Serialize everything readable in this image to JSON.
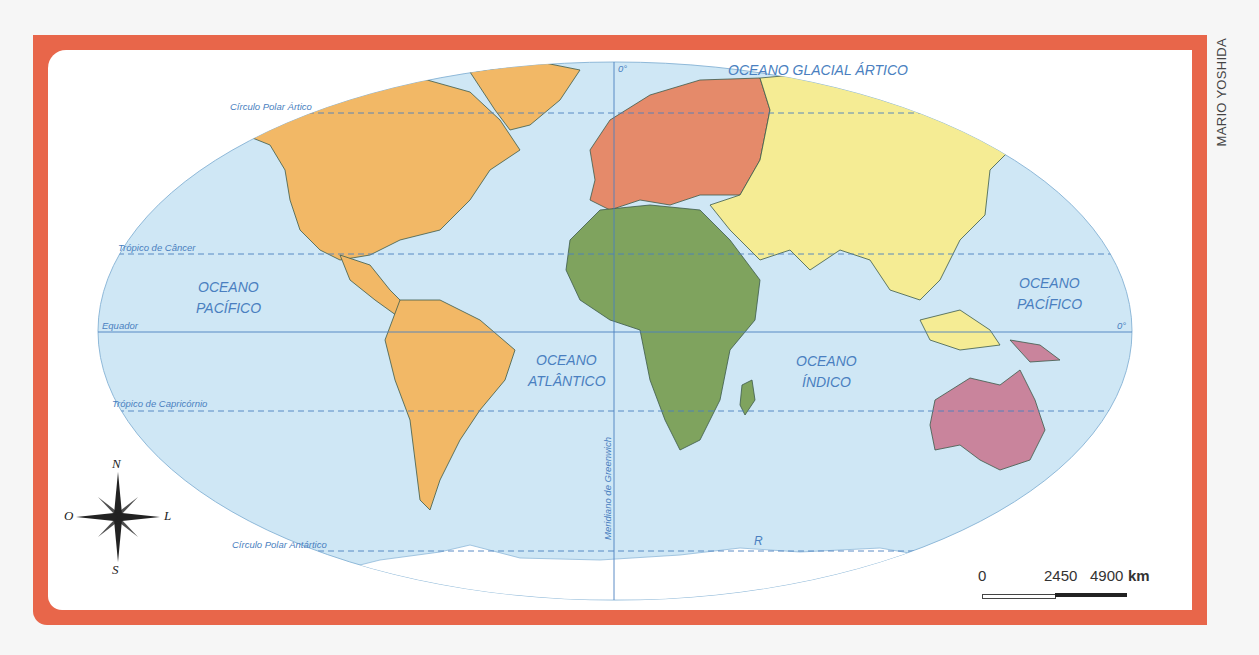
{
  "credit": "MARIO YOSHIDA",
  "colors": {
    "frame": "#e8664a",
    "ocean": "#cfe7f5",
    "americas": "#f2b866",
    "europe": "#e58a6a",
    "africa": "#7fa35e",
    "asia": "#f5ec94",
    "oceania": "#c9849c",
    "antarctica": "#ffffff",
    "label": "#4a7fc0"
  },
  "oceans": {
    "glacial_artico": "OCEANO GLACIAL ÁRTICO",
    "pacifico_w_1": "OCEANO",
    "pacifico_w_2": "PACÍFICO",
    "pacifico_e_1": "OCEANO",
    "pacifico_e_2": "PACÍFICO",
    "atlantico_1": "OCEANO",
    "atlantico_2": "ATLÂNTICO",
    "indico_1": "OCEANO",
    "indico_2": "ÍNDICO"
  },
  "lines": {
    "arctic_circle": "Círculo Polar Ártico",
    "tropic_cancer": "Trópico de Câncer",
    "equator": "Equador",
    "tropic_capricorn": "Trópico de Capricórnio",
    "antarctic_circle": "Círculo Polar Antártico",
    "greenwich": "Meridiano de Greenwich",
    "zero_meridian": "0°",
    "zero_equator": "0°",
    "r_label": "R"
  },
  "compass": {
    "n": "N",
    "s": "S",
    "e": "L",
    "w": "O"
  },
  "scale": {
    "v0": "0",
    "v1": "2450",
    "v2": "4900",
    "unit": "km"
  }
}
